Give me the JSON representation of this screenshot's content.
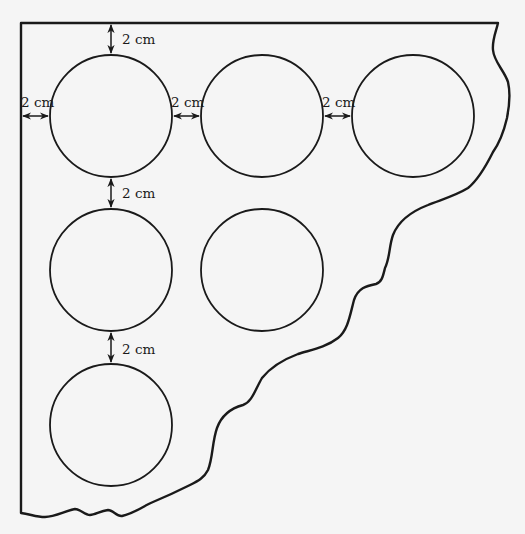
{
  "diagram": {
    "colors": {
      "background": "#f5f5f5",
      "stroke": "#1a1a1a"
    },
    "circles": [
      {
        "id": "r1c1",
        "cx": 111,
        "cy": 116,
        "r": 61
      },
      {
        "id": "r1c2",
        "cx": 262,
        "cy": 116,
        "r": 61
      },
      {
        "id": "r1c3",
        "cx": 413,
        "cy": 116,
        "r": 61
      },
      {
        "id": "r2c1",
        "cx": 111,
        "cy": 270,
        "r": 61
      },
      {
        "id": "r2c2",
        "cx": 262,
        "cy": 270,
        "r": 61
      },
      {
        "id": "r3c1",
        "cx": 111,
        "cy": 425,
        "r": 61
      }
    ],
    "dimensions": [
      {
        "id": "top-gap",
        "label": "2 cm"
      },
      {
        "id": "left-gap",
        "label": "2 cm"
      },
      {
        "id": "gap-c1-c2",
        "label": "2 cm"
      },
      {
        "id": "gap-c2-c3",
        "label": "2 cm"
      },
      {
        "id": "gap-row1-row2",
        "label": "2 cm"
      },
      {
        "id": "gap-row2-row3",
        "label": "2 cm"
      }
    ]
  }
}
